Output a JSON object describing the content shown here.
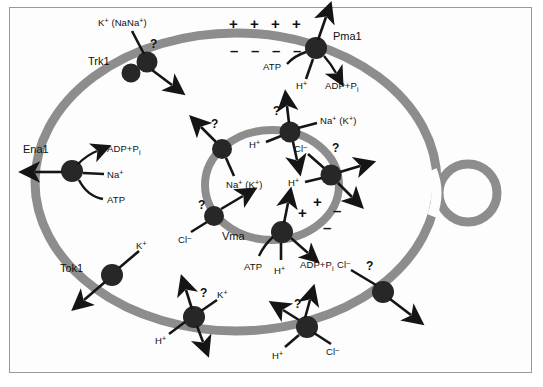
{
  "figure": {
    "colors": {
      "membrane": "#8d8d8d",
      "protein": "#272727",
      "arrow": "#151515",
      "text": "#101010",
      "background": "#fdfdfd",
      "frame_border": "#9a9a9a"
    }
  },
  "membrane_charges": {
    "outer_plus": [
      "+",
      "+",
      "+",
      "+"
    ],
    "outer_minus": [
      "–",
      "–",
      "–",
      "–"
    ],
    "vacuole_plus": [
      "+",
      "+"
    ],
    "vacuole_minus": [
      "–",
      "–"
    ]
  },
  "transporters": [
    {
      "id": "trk1",
      "name": "Trk1",
      "location": "plasma-membrane",
      "substrates": [
        "K+ (Na+)"
      ],
      "unknown_marker": "?"
    },
    {
      "id": "pma1",
      "name": "Pma1",
      "location": "plasma-membrane",
      "substrates": [
        "ATP",
        "H+",
        "ADP+Pi"
      ],
      "unknown_marker": ""
    },
    {
      "id": "ena1",
      "name": "Ena1",
      "location": "plasma-membrane",
      "substrates": [
        "ADP+Pi",
        "Na+",
        "ATP"
      ],
      "unknown_marker": ""
    },
    {
      "id": "tok1",
      "name": "Tok1",
      "location": "plasma-membrane",
      "substrates": [
        "K+"
      ],
      "unknown_marker": ""
    },
    {
      "id": "pm-kh-antiporter",
      "name": "",
      "location": "plasma-membrane",
      "substrates": [
        "K+",
        "H+"
      ],
      "unknown_marker": "?"
    },
    {
      "id": "pm-clh-antiporter",
      "name": "",
      "location": "plasma-membrane",
      "substrates": [
        "H+",
        "Cl-"
      ],
      "unknown_marker": "?"
    },
    {
      "id": "pm-cl-channel",
      "name": "",
      "location": "plasma-membrane",
      "substrates": [
        "Cl-"
      ],
      "unknown_marker": "?"
    },
    {
      "id": "vac-na-left",
      "name": "",
      "location": "vacuolar-membrane",
      "substrates": [
        "Na+ (K+)"
      ],
      "unknown_marker": "?"
    },
    {
      "id": "vac-nah-antiporter",
      "name": "",
      "location": "vacuolar-membrane",
      "substrates": [
        "Na+ (K+)",
        "H+"
      ],
      "unknown_marker": "?"
    },
    {
      "id": "vac-clh-antiporter",
      "name": "",
      "location": "vacuolar-membrane",
      "substrates": [
        "Cl-",
        "H+"
      ],
      "unknown_marker": "?"
    },
    {
      "id": "vac-cl-left",
      "name": "",
      "location": "vacuolar-membrane",
      "substrates": [
        "Cl-"
      ],
      "unknown_marker": "?"
    },
    {
      "id": "vma",
      "name": "Vma",
      "location": "vacuolar-membrane",
      "substrates": [
        "ATP",
        "H+",
        "ADP+Pi"
      ],
      "unknown_marker": ""
    }
  ],
  "labels": {
    "trk1_name": "Trk1",
    "trk1_substrate_main": "K",
    "trk1_substrate_sup": "+",
    "trk1_substrate_paren": " (Na",
    "trk1_substrate_paren2": ")",
    "trk1_q": "?",
    "pma1_name": "Pma1",
    "pma1_atp": "ATP",
    "pma1_h": "H",
    "pma1_adp": "ADP+P",
    "ena1_name": "Ena1",
    "ena1_adp": "ADP+P",
    "ena1_na": "Na",
    "ena1_atp": "ATP",
    "tok1_name": "Tok1",
    "tok1_k": "K",
    "pm_k": "K",
    "pm_h": "H",
    "pm_q": "?",
    "pm_cl_h": "H",
    "pm_cl": "Cl",
    "pm_cl_q": "?",
    "pm_cl2": "Cl",
    "pm_cl2_q": "?",
    "vac_na_left": "Na",
    "vac_na_left_paren": " (K",
    "vac_q1": "?",
    "vac_na_top": "Na",
    "vac_h_top": "H",
    "vac_q2": "?",
    "vac_cl_right": "Cl",
    "vac_h_right": "H",
    "vac_q3": "?",
    "vac_cl_left": "Cl",
    "vac_q4": "?",
    "vma_name": "Vma",
    "vma_atp": "ATP",
    "vma_h": "H",
    "vma_adp": "ADP+P",
    "sup_plus": "+",
    "sup_minus": "–",
    "sub_i": "i",
    "paren_close": ")"
  }
}
